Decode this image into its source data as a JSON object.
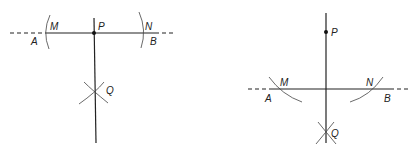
{
  "figures": [
    {
      "id": "left",
      "description": "Perpendicular from point P on line AB",
      "labels": {
        "M": "M",
        "P": "P",
        "N": "N",
        "A": "A",
        "B": "B",
        "Q": "Q"
      }
    },
    {
      "id": "right",
      "description": "Perpendicular from point P off line AB",
      "labels": {
        "P": "P",
        "M": "M",
        "N": "N",
        "A": "A",
        "B": "B",
        "Q": "Q"
      }
    }
  ],
  "colors": {
    "stroke": "#222222",
    "background": "#ffffff"
  }
}
